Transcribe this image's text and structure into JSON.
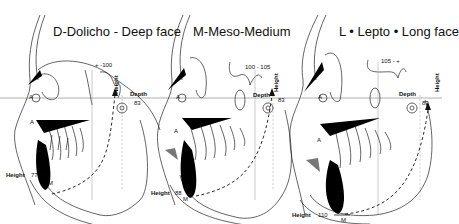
{
  "panels": [
    {
      "id": "dolicho",
      "title": "D-Dolicho - Deep face",
      "range_label": "+ -100",
      "depth_label": "Depth",
      "depth_value": "83",
      "height_axis_label": "Height",
      "height_label": "Height",
      "height_value": "77",
      "point_a": "A",
      "point_m": "M"
    },
    {
      "id": "meso",
      "title": "M-Meso-Medium",
      "range_label": "100 - 105",
      "depth_label": "Depth",
      "depth_value": "83",
      "height_axis_label": "Height",
      "height_label": "Height",
      "height_value": "88",
      "point_a": "A",
      "point_m": "M"
    },
    {
      "id": "lepto",
      "title": "L • Lepto • Long face",
      "range_label": "105 - +",
      "depth_label": "Depth",
      "depth_value": "83",
      "height_axis_label": "Height",
      "height_label": "Height",
      "height_value": "110",
      "point_a": "A",
      "point_m": "M"
    }
  ],
  "colors": {
    "line": "#1a1a1a",
    "fill": "#000000",
    "soft_tissue": "#777777",
    "background": "#ffffff"
  }
}
